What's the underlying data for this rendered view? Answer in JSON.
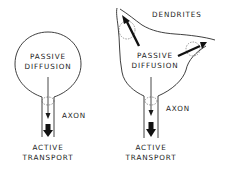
{
  "diagram": {
    "left_neuron": {
      "type": "cell without dendrites",
      "labels": {
        "diffusion_line1": "PASSIVE",
        "diffusion_line2": "DIFFUSION",
        "axon": "AXON",
        "transport_line1": "ACTIVE",
        "transport_line2": "TRANSPORT"
      }
    },
    "right_neuron": {
      "type": "cell with dendrites",
      "labels": {
        "dendrites": "DENDRITES",
        "diffusion_line1": "PASSIVE",
        "diffusion_line2": "DIFFUSION",
        "axon": "AXON",
        "transport_line1": "ACTIVE",
        "transport_line2": "TRANSPORT"
      }
    },
    "colors": {
      "ink": "#1a1a1a",
      "background": "#ffffff"
    }
  }
}
